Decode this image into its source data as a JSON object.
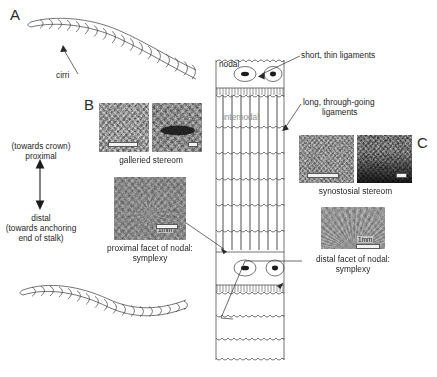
{
  "figure": {
    "panels": [
      {
        "id": "A",
        "letter": "A"
      },
      {
        "id": "B",
        "letter": "B"
      },
      {
        "id": "C",
        "letter": "C"
      }
    ],
    "labels": {
      "cirri": "cirri",
      "nodal": "nodal",
      "internodal": "internodal",
      "short_thin_ligaments": "short, thin ligaments",
      "long_through_going_ligaments_line1": "long, through-going",
      "long_through_going_ligaments_line2": "ligaments",
      "galleried_stereom": "galleried stereom",
      "synostosial_stereom": "synostosial stereom",
      "proximal_facet_line1": "proximal facet of nodal:",
      "proximal_facet_line2": "symplexy",
      "distal_facet_line1": "distal facet of nodal:",
      "distal_facet_line2": "symplexy"
    },
    "orientation_axis": {
      "top_line1": "(towards crown)",
      "top_line2": "proximal",
      "bottom_line1": "distal",
      "bottom_line2": "(towards anchoring",
      "bottom_line3": "end of stalk)"
    },
    "scale_bars": {
      "proximal_facet": "1mm",
      "distal_facet": "1mm"
    },
    "colors": {
      "line": "#3a3a3a",
      "text": "#262626",
      "muted_text": "#8d8d8d",
      "background": "#ffffff",
      "ligament_line": "#5e5e5e",
      "micrograph_mid": "#8e8b86",
      "micrograph_dark": "#3a3a38"
    }
  }
}
